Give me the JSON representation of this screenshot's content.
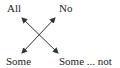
{
  "diagram": {
    "corners": {
      "top_left": "All",
      "top_right": "No",
      "bottom_left": "Some",
      "bottom_right": "Some ... not"
    },
    "relations": [
      {
        "from": "All",
        "to": "Some ... not",
        "type": "double-arrow"
      },
      {
        "from": "No",
        "to": "Some",
        "type": "double-arrow"
      }
    ],
    "colors": {
      "text": "#222222",
      "arrow": "#333333",
      "background": "#ffffff"
    }
  }
}
